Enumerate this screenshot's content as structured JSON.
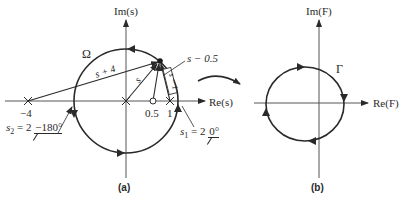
{
  "figure_a": {
    "caption": "(a)",
    "axis_im_label": "Im(s)",
    "axis_re_label": "Re(s)",
    "contour_label": "Ω",
    "vector_labels": {
      "s_plus_4": "s + 4",
      "s": "s",
      "s_minus_0_5": "s − 0.5",
      "s_minus_1": "s − 1"
    },
    "tick_labels": {
      "minus_4": "−4",
      "zero_point_five": "0.5",
      "one": "1"
    },
    "annotations": {
      "s2_prefix": "s",
      "s2_sub": "2",
      "s2_value": " = 2",
      "s2_angle": "−180°",
      "s1_prefix": "s",
      "s1_sub": "1",
      "s1_value": " = 2",
      "s1_angle": "0°"
    },
    "markers": {
      "poles": [
        "−4",
        "0",
        "1"
      ],
      "zeros": [
        "0.5"
      ]
    }
  },
  "figure_b": {
    "caption": "(b)",
    "axis_im_label": "Im(F)",
    "axis_re_label": "Re(F)",
    "contour_label": "Γ"
  },
  "colors": {
    "ink": "#2a2a2a",
    "axis": "#555555"
  }
}
